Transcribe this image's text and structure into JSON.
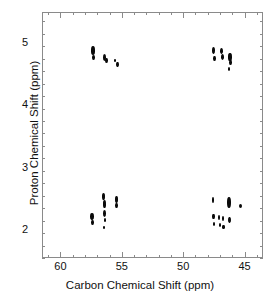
{
  "chart_data": {
    "type": "scatter",
    "title": "",
    "xlabel": "Carbon Chemical Shift (ppm)",
    "ylabel": "Proton Chemical Shift (ppm)",
    "xlim": [
      61.5,
      43.5
    ],
    "ylim": [
      1.55,
      5.5
    ],
    "x_reversed": true,
    "y_reversed": true,
    "grid": false,
    "legend": null,
    "xticks": [
      60,
      55,
      50,
      45
    ],
    "yticks": [
      5,
      4,
      3,
      2
    ],
    "x_minor_tick_step": 1,
    "y_minor_tick_step": 0.2,
    "xticklabels": [
      "60",
      "55",
      "50",
      "45"
    ],
    "yticklabels": [
      "5",
      "4",
      "3",
      "2"
    ],
    "marker_color": "#0a0a0a",
    "frame_color": "#8a8a8a",
    "series": [
      {
        "name": "HSQC cross peaks",
        "points": [
          {
            "x": 57.45,
            "y": 4.9,
            "w": 4.0,
            "h": 8.5
          },
          {
            "x": 57.4,
            "y": 4.79,
            "w": 3.2,
            "h": 5.0
          },
          {
            "x": 56.5,
            "y": 4.79,
            "w": 3.6,
            "h": 7.0
          },
          {
            "x": 56.35,
            "y": 4.73,
            "w": 3.0,
            "h": 5.0
          },
          {
            "x": 55.6,
            "y": 4.73,
            "w": 2.0,
            "h": 3.0
          },
          {
            "x": 55.45,
            "y": 4.67,
            "w": 2.6,
            "h": 5.5
          },
          {
            "x": 47.6,
            "y": 4.9,
            "w": 3.0,
            "h": 6.5
          },
          {
            "x": 47.55,
            "y": 4.77,
            "w": 2.8,
            "h": 5.0
          },
          {
            "x": 46.95,
            "y": 4.89,
            "w": 3.0,
            "h": 6.0
          },
          {
            "x": 46.9,
            "y": 4.79,
            "w": 3.2,
            "h": 6.0
          },
          {
            "x": 46.25,
            "y": 4.8,
            "w": 3.6,
            "h": 8.0
          },
          {
            "x": 46.2,
            "y": 4.71,
            "w": 3.0,
            "h": 5.0
          },
          {
            "x": 46.35,
            "y": 4.6,
            "w": 2.6,
            "h": 4.5
          },
          {
            "x": 57.5,
            "y": 2.23,
            "w": 3.4,
            "h": 6.5
          },
          {
            "x": 57.45,
            "y": 2.13,
            "w": 3.0,
            "h": 5.0
          },
          {
            "x": 56.55,
            "y": 2.55,
            "w": 3.4,
            "h": 7.0
          },
          {
            "x": 56.5,
            "y": 2.43,
            "w": 3.2,
            "h": 7.5
          },
          {
            "x": 56.5,
            "y": 2.28,
            "w": 3.2,
            "h": 6.5
          },
          {
            "x": 56.45,
            "y": 2.18,
            "w": 2.8,
            "h": 4.5
          },
          {
            "x": 56.5,
            "y": 2.05,
            "w": 2.2,
            "h": 3.0
          },
          {
            "x": 55.55,
            "y": 2.5,
            "w": 3.0,
            "h": 7.0
          },
          {
            "x": 55.5,
            "y": 2.41,
            "w": 2.8,
            "h": 5.0
          },
          {
            "x": 47.65,
            "y": 2.5,
            "w": 2.6,
            "h": 5.5
          },
          {
            "x": 47.6,
            "y": 2.23,
            "w": 2.4,
            "h": 5.0
          },
          {
            "x": 47.55,
            "y": 2.12,
            "w": 2.2,
            "h": 4.0
          },
          {
            "x": 47.15,
            "y": 2.22,
            "w": 2.4,
            "h": 5.0
          },
          {
            "x": 47.1,
            "y": 2.1,
            "w": 2.2,
            "h": 4.0
          },
          {
            "x": 46.85,
            "y": 2.2,
            "w": 2.4,
            "h": 5.0
          },
          {
            "x": 46.8,
            "y": 2.06,
            "w": 2.2,
            "h": 4.0
          },
          {
            "x": 46.35,
            "y": 2.46,
            "w": 4.2,
            "h": 11.0
          },
          {
            "x": 46.3,
            "y": 2.18,
            "w": 2.8,
            "h": 6.5
          },
          {
            "x": 45.4,
            "y": 2.4,
            "w": 3.4,
            "h": 4.5
          }
        ]
      }
    ]
  }
}
